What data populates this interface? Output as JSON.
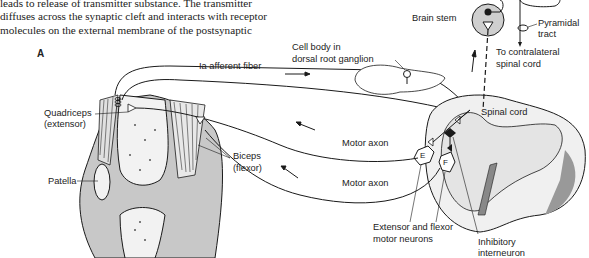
{
  "text": {
    "lines": [
      "leads to release of transmitter substance. The transmitter",
      "diffuses across the synaptic cleft and interacts with receptor",
      "molecules on the external membrane of the postsynaptic"
    ]
  },
  "figure": {
    "panel_label": "A",
    "labels": {
      "brain_stem": "Brain stem",
      "pyramidal_1": "Pyramidal",
      "pyramidal_2": "tract",
      "contra_1": "To contralateral",
      "contra_2": "spinal cord",
      "cell_body_1": "Cell body in",
      "cell_body_2": "dorsal root ganglion",
      "ia_fiber": "Ia afferent fiber",
      "quadriceps_1": "Quadriceps",
      "quadriceps_2": "(extensor)",
      "spinal_cord": "Spinal cord",
      "motor_axon_1": "Motor axon",
      "motor_axon_2": "Motor axon",
      "biceps_1": "Biceps",
      "biceps_2": "(flexor)",
      "patella": "Patella",
      "ext_flex_1": "Extensor and flexor",
      "ext_flex_2": "motor neurons",
      "inhib_1": "Inhibitory",
      "inhib_2": "interneuron",
      "neuron_e": "E",
      "neuron_f": "F"
    },
    "colors": {
      "line": "#1a1a1a",
      "gray_fill": "#c8c8c8",
      "light_fill": "#ececec"
    }
  }
}
